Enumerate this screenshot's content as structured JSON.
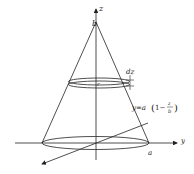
{
  "diagram": {
    "type": "cone-volume-by-disks",
    "labels": {
      "z_axis": "z",
      "y_axis": "y",
      "apex": "b",
      "base_radius": "a",
      "disk_radius": "r",
      "thickness": "dz",
      "equation_prefix": "y=a",
      "equation_open": "(",
      "equation_one_minus": "1−",
      "equation_num": "z",
      "equation_den": "b",
      "equation_close": ")"
    },
    "colors": {
      "stroke": "#222222",
      "background": "#ffffff"
    }
  }
}
